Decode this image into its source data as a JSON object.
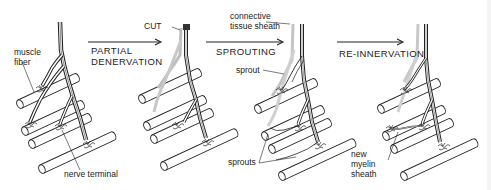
{
  "diagram": {
    "stages": [
      {
        "id": "normal",
        "label": ""
      },
      {
        "id": "partial-denervation",
        "arrow_label_line1": "PARTIAL",
        "arrow_label_line2": "DENERVATION"
      },
      {
        "id": "sprouting",
        "arrow_label": "SPROUTING"
      },
      {
        "id": "re-innervation",
        "arrow_label": "RE-INNERVATION"
      }
    ],
    "labels": {
      "muscle_fiber_line1": "muscle",
      "muscle_fiber_line2": "fiber",
      "nerve_terminal": "nerve terminal",
      "cut": "CUT",
      "connective_line1": "connective",
      "connective_line2": "tissue sheath",
      "sprout": "sprout",
      "sprouts": "sprouts",
      "new_myelin_line1": "new",
      "new_myelin_line2": "myelin",
      "new_myelin_line3": "sheath"
    },
    "colors": {
      "ink": "#222222",
      "faded_axon": "#bdbdbd",
      "background": "#ffffff"
    }
  }
}
